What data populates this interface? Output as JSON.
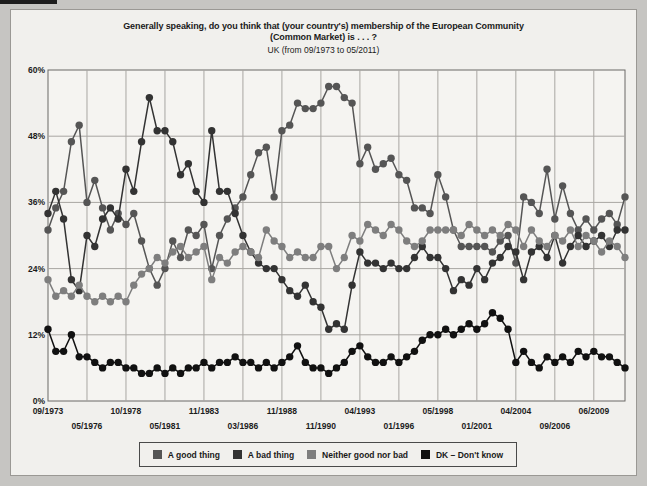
{
  "title": {
    "line1": "Generally speaking, do you think that (your country's) membership of the European Community",
    "line2": "(Common Market) is . . . ?",
    "line3": "UK (from 09/1973 to 05/2011)"
  },
  "legend": {
    "items": [
      {
        "label": "A good thing"
      },
      {
        "label": "A bad thing"
      },
      {
        "label": "Neither good nor bad"
      },
      {
        "label": "DK – Don't know"
      }
    ]
  },
  "chart_data": {
    "type": "line",
    "title": "Generally speaking, do you think that (your country's) membership of the European Community (Common Market) is . . . ?",
    "subtitle": "UK (from 09/1973 to 05/2011)",
    "xlabel": "",
    "ylabel": "",
    "ylim": [
      0,
      60
    ],
    "grid": true,
    "legend_position": "bottom",
    "n_points": 75,
    "x_range_labels": [
      "09/1973",
      "05/2011"
    ],
    "y_ticks": [
      {
        "v": 0,
        "label": "0%"
      },
      {
        "v": 12,
        "label": "12%"
      },
      {
        "v": 24,
        "label": "24%"
      },
      {
        "v": 36,
        "label": "36%"
      },
      {
        "v": 48,
        "label": "48%"
      },
      {
        "v": 60,
        "label": "60%"
      }
    ],
    "x_ticks": [
      {
        "i": 0,
        "label": "09/1973",
        "row": 0
      },
      {
        "i": 5,
        "label": "05/1976",
        "row": 1
      },
      {
        "i": 10,
        "label": "10/1978",
        "row": 0
      },
      {
        "i": 15,
        "label": "05/1981",
        "row": 1
      },
      {
        "i": 20,
        "label": "11/1983",
        "row": 0
      },
      {
        "i": 25,
        "label": "03/1986",
        "row": 1
      },
      {
        "i": 30,
        "label": "11/1988",
        "row": 0
      },
      {
        "i": 35,
        "label": "11/1990",
        "row": 1
      },
      {
        "i": 40,
        "label": "04/1993",
        "row": 0
      },
      {
        "i": 45,
        "label": "01/1996",
        "row": 1
      },
      {
        "i": 50,
        "label": "05/1998",
        "row": 0
      },
      {
        "i": 55,
        "label": "01/2001",
        "row": 1
      },
      {
        "i": 60,
        "label": "04/2004",
        "row": 0
      },
      {
        "i": 65,
        "label": "09/2006",
        "row": 1
      },
      {
        "i": 70,
        "label": "06/2009",
        "row": 0
      }
    ],
    "series": [
      {
        "name": "A good thing",
        "color": "#555555",
        "values": [
          31,
          35,
          38,
          47,
          50,
          36,
          40,
          35,
          31,
          34,
          32,
          34,
          29,
          24,
          21,
          24,
          29,
          26,
          31,
          30,
          32,
          24,
          30,
          33,
          35,
          37,
          41,
          45,
          46,
          37,
          49,
          50,
          54,
          53,
          53,
          54,
          57,
          57,
          55,
          54,
          43,
          46,
          42,
          43,
          44,
          41,
          40,
          35,
          35,
          34,
          41,
          37,
          31,
          28,
          28,
          28,
          28,
          27,
          29,
          30,
          25,
          37,
          36,
          34,
          42,
          33,
          39,
          34,
          31,
          33,
          31,
          33,
          34,
          32,
          37
        ]
      },
      {
        "name": "A bad thing",
        "color": "#333333",
        "values": [
          34,
          38,
          33,
          22,
          20,
          30,
          28,
          33,
          35,
          33,
          42,
          38,
          47,
          55,
          49,
          49,
          47,
          41,
          43,
          38,
          36,
          49,
          38,
          38,
          34,
          30,
          27,
          25,
          24,
          24,
          22,
          20,
          19,
          21,
          18,
          17,
          13,
          14,
          13,
          21,
          27,
          25,
          25,
          24,
          25,
          24,
          24,
          26,
          28,
          26,
          26,
          24,
          20,
          22,
          21,
          24,
          22,
          25,
          26,
          28,
          27,
          22,
          27,
          28,
          26,
          30,
          25,
          28,
          30,
          28,
          29,
          30,
          28,
          31,
          31
        ]
      },
      {
        "name": "Neither good nor bad",
        "color": "#7e7e7e",
        "values": [
          22,
          19,
          20,
          19,
          21,
          19,
          18,
          19,
          18,
          19,
          18,
          21,
          23,
          24,
          26,
          25,
          27,
          28,
          26,
          27,
          28,
          22,
          26,
          25,
          27,
          28,
          27,
          26,
          31,
          29,
          28,
          26,
          27,
          26,
          26,
          28,
          28,
          24,
          26,
          30,
          29,
          32,
          31,
          30,
          32,
          31,
          29,
          28,
          29,
          31,
          31,
          31,
          31,
          30,
          32,
          31,
          30,
          31,
          30,
          32,
          31,
          28,
          31,
          29,
          28,
          30,
          29,
          31,
          28,
          30,
          29,
          27,
          29,
          28,
          26
        ]
      },
      {
        "name": "DK – Don't know",
        "color": "#111111",
        "values": [
          13,
          9,
          9,
          12,
          8,
          8,
          7,
          6,
          7,
          7,
          6,
          6,
          5,
          5,
          6,
          5,
          6,
          5,
          6,
          6,
          7,
          6,
          7,
          7,
          8,
          7,
          7,
          6,
          7,
          6,
          7,
          8,
          10,
          7,
          6,
          6,
          5,
          6,
          7,
          9,
          10,
          8,
          7,
          7,
          8,
          7,
          8,
          9,
          11,
          12,
          12,
          13,
          12,
          13,
          14,
          13,
          14,
          16,
          15,
          13,
          7,
          9,
          7,
          6,
          8,
          7,
          8,
          7,
          9,
          8,
          9,
          8,
          8,
          7,
          6
        ]
      }
    ],
    "plot_colors": {
      "plot_background": "#f5f4f1",
      "panel_background": "#f1f0ed",
      "gridline": "#a8a6a2",
      "plot_border": "#6b6966"
    }
  }
}
